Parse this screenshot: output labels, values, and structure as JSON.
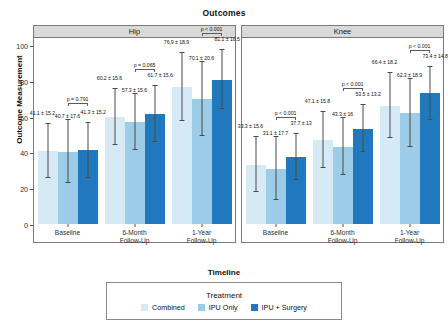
{
  "chart": {
    "title": "Outcomes",
    "y_axis_title": "Outcome Measurement",
    "x_axis_title": "Timeline"
  },
  "legend": {
    "title": "Treatment",
    "items": [
      {
        "label": "Combined",
        "color": "#d6eaf6"
      },
      {
        "label": "IPU Only",
        "color": "#9dcce8"
      },
      {
        "label": "IPU + Surgery",
        "color": "#2079bd"
      }
    ]
  },
  "panels": [
    {
      "label": "Hip"
    },
    {
      "label": "Knee"
    }
  ],
  "x_ticks": [
    {
      "line1": "Baseline",
      "line2": ""
    },
    {
      "line1": "6-Month",
      "line2": "Follow-Up"
    },
    {
      "line1": "1-Year",
      "line2": "Follow-Up"
    }
  ],
  "y_ticks": [
    "0",
    "20",
    "40",
    "60",
    "80",
    "100"
  ],
  "chart_data": {
    "type": "bar",
    "title": "Outcomes",
    "xlabel": "Timeline",
    "ylabel": "Outcome Measurement",
    "ylim": [
      0,
      105
    ],
    "yticks": [
      0,
      20,
      40,
      60,
      80,
      100
    ],
    "grid": false,
    "legend_position": "bottom",
    "legend_title": "Treatment",
    "facets": [
      "Hip",
      "Knee"
    ],
    "categories": [
      "Baseline",
      "6-Month Follow-Up",
      "1-Year Follow-Up"
    ],
    "series": [
      {
        "name": "Combined",
        "color": "#d6eaf6"
      },
      {
        "name": "IPU Only",
        "color": "#9dcce8"
      },
      {
        "name": "IPU + Surgery",
        "color": "#2079bd"
      }
    ],
    "panels": [
      {
        "facet": "Hip",
        "groups": [
          {
            "category": "Baseline",
            "p_value": "p = 0.791",
            "bars": [
              {
                "series": "Combined",
                "mean": 41.1,
                "sd": 15.2,
                "label": "41.1 ± 15.2"
              },
              {
                "series": "IPU Only",
                "mean": 40.7,
                "sd": 17.6,
                "label": "40.7 ± 17.6"
              },
              {
                "series": "IPU + Surgery",
                "mean": 41.3,
                "sd": 15.2,
                "label": "41.3 ± 15.2"
              }
            ]
          },
          {
            "category": "6-Month Follow-Up",
            "p_value": "p = 0.065",
            "bars": [
              {
                "series": "Combined",
                "mean": 60.2,
                "sd": 15.6,
                "label": "60.2 ± 15.6"
              },
              {
                "series": "IPU Only",
                "mean": 57.3,
                "sd": 15.6,
                "label": "57.3 ± 15.6"
              },
              {
                "series": "IPU + Surgery",
                "mean": 61.7,
                "sd": 15.6,
                "label": "61.7 ± 15.6"
              }
            ]
          },
          {
            "category": "1-Year Follow-Up",
            "p_value": "p < 0.001",
            "bars": [
              {
                "series": "Combined",
                "mean": 76.9,
                "sd": 18.9,
                "label": "76.9 ± 18.9"
              },
              {
                "series": "IPU Only",
                "mean": 70.1,
                "sd": 20.6,
                "label": "70.1 ± 20.6"
              },
              {
                "series": "IPU + Surgery",
                "mean": 81.1,
                "sd": 16.5,
                "label": "81.1 ± 16.5"
              }
            ]
          }
        ]
      },
      {
        "facet": "Knee",
        "groups": [
          {
            "category": "Baseline",
            "p_value": "p < 0.001",
            "bars": [
              {
                "series": "Combined",
                "mean": 33.3,
                "sd": 15.6,
                "label": "33.3 ± 15.6"
              },
              {
                "series": "IPU Only",
                "mean": 31.1,
                "sd": 17.7,
                "label": "31.1 ± 17.7"
              },
              {
                "series": "IPU + Surgery",
                "mean": 37.7,
                "sd": 13.0,
                "label": "37.7 ± 13"
              }
            ]
          },
          {
            "category": "6-Month Follow-Up",
            "p_value": "p < 0.001",
            "bars": [
              {
                "series": "Combined",
                "mean": 47.1,
                "sd": 15.8,
                "label": "47.1 ± 15.8"
              },
              {
                "series": "IPU Only",
                "mean": 43.3,
                "sd": 16.0,
                "label": "43.3 ± 16"
              },
              {
                "series": "IPU + Surgery",
                "mean": 53.5,
                "sd": 13.2,
                "label": "53.5 ± 13.2"
              }
            ]
          },
          {
            "category": "1-Year Follow-Up",
            "p_value": "p < 0.001",
            "bars": [
              {
                "series": "Combined",
                "mean": 66.4,
                "sd": 18.2,
                "label": "66.4 ± 18.2"
              },
              {
                "series": "IPU Only",
                "mean": 62.3,
                "sd": 18.9,
                "label": "62.3 ± 18.9"
              },
              {
                "series": "IPU + Surgery",
                "mean": 73.4,
                "sd": 14.8,
                "label": "73.4 ± 14.8"
              }
            ]
          }
        ]
      }
    ]
  }
}
